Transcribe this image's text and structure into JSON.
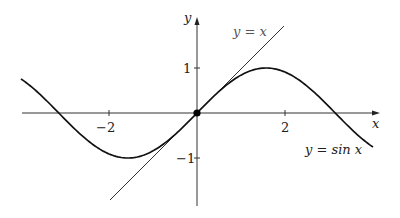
{
  "chart_data": {
    "type": "line",
    "title": "",
    "xlabel": "x",
    "ylabel": "y",
    "xlim": [
      -4,
      4.3
    ],
    "ylim": [
      -1.9,
      2.1
    ],
    "x_ticks": [
      -2,
      2
    ],
    "y_ticks": [
      -1,
      1
    ],
    "x_tick_labels": [
      "−2",
      "2"
    ],
    "y_tick_labels": [
      "−1",
      "1"
    ],
    "grid": false,
    "series": [
      {
        "name": "y = sin x",
        "function": "sin(x)",
        "domain": [
          -4,
          4
        ],
        "color": "#111111",
        "width": 1.6
      },
      {
        "name": "y = x",
        "function": "x",
        "domain": [
          -1.95,
          1.95
        ],
        "color": "#333333",
        "width": 1.0
      }
    ],
    "points": [
      {
        "x": 0,
        "y": 0,
        "label": "origin"
      }
    ],
    "annotations": [
      {
        "text": "y = x",
        "near": [
          1.0,
          1.8
        ]
      },
      {
        "text": "y = sin x",
        "near": [
          3.3,
          -0.75
        ]
      }
    ]
  },
  "labels": {
    "x_axis": "x",
    "y_axis": "y",
    "tick_neg2": "−2",
    "tick_2": "2",
    "tick_1": "1",
    "tick_neg1": "−1",
    "line_label": "y = x",
    "sine_label": "y = sin x"
  }
}
